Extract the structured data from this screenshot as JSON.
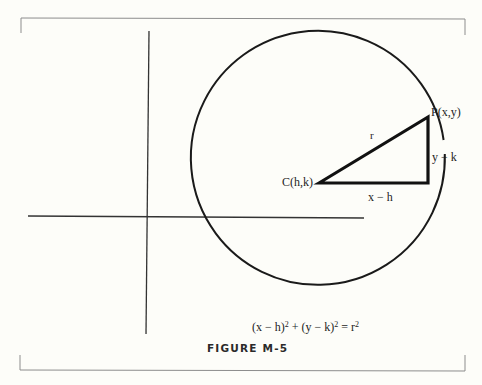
{
  "figure": {
    "caption": "FIGURE M-5",
    "equation": {
      "part1": "(x − h)",
      "exp1": "2",
      "part2": " + (y − k)",
      "exp2": "2",
      "part3": " = r",
      "exp3": "2"
    },
    "labels": {
      "point_p": "P(x,y)",
      "center_c": "C(h,k)",
      "radius": "r",
      "vertical_leg": "y − k",
      "horizontal_leg": "x − h"
    },
    "colors": {
      "background": "#fdfdf9",
      "ink": "#1c1c1c",
      "frame": "#8a8a8a"
    }
  }
}
